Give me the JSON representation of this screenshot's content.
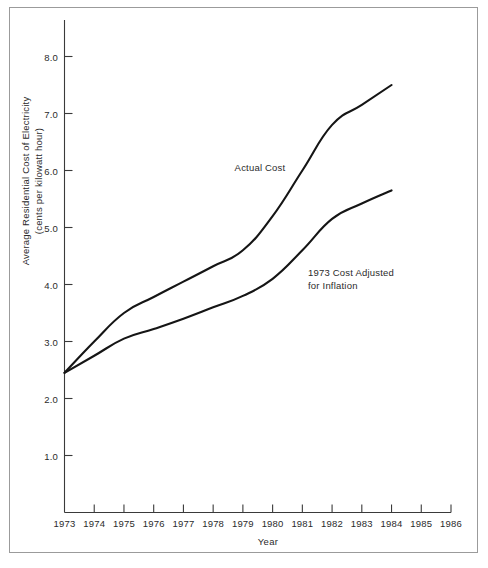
{
  "chart_data": {
    "type": "line",
    "title": "",
    "xlabel": "Year",
    "ylabel": "Average Residential Cost of Electricity (cents per kilowatt hour)",
    "ylabel_line1": "Average Residential Cost of Electricity",
    "ylabel_line2": "(cents per kilowatt hour)",
    "x": [
      1973,
      1974,
      1975,
      1976,
      1977,
      1978,
      1979,
      1980,
      1981,
      1982,
      1983,
      1984
    ],
    "xlim": [
      1973,
      1986
    ],
    "ylim": [
      0,
      8.55
    ],
    "grid": false,
    "legend_position": "inline-annotations",
    "xticks": [
      "1973",
      "1974",
      "1975",
      "1976",
      "1977",
      "1978",
      "1979",
      "1980",
      "1981",
      "1982",
      "1983",
      "1984",
      "1985",
      "1986"
    ],
    "yticks": [
      "1.0",
      "2.0",
      "3.0",
      "4.0",
      "5.0",
      "6.0",
      "7.0",
      "8.0"
    ],
    "ytick_values": [
      1.0,
      2.0,
      3.0,
      4.0,
      5.0,
      6.0,
      7.0,
      8.0
    ],
    "series": [
      {
        "name": "Actual Cost",
        "values": [
          2.45,
          3.0,
          3.5,
          3.78,
          4.05,
          4.32,
          4.6,
          5.2,
          6.0,
          6.8,
          7.15,
          7.5
        ]
      },
      {
        "name": "1973 Cost Adjusted for Inflation",
        "values": [
          2.45,
          2.75,
          3.05,
          3.22,
          3.4,
          3.6,
          3.8,
          4.1,
          4.6,
          5.15,
          5.42,
          5.65
        ]
      }
    ],
    "annotations": [
      {
        "text": "Actual Cost",
        "x": 1980.0,
        "y": 6.05
      },
      {
        "text_line1": "1973 Cost Adjusted",
        "text_line2": "for Inflation",
        "x": 1982.2,
        "y": 4.2
      }
    ],
    "colors": {
      "line": "#151515",
      "axis": "#3a3a3a",
      "frame": "#9b9b9b",
      "background": "#ffffff",
      "text": "#2b2b2b"
    }
  }
}
